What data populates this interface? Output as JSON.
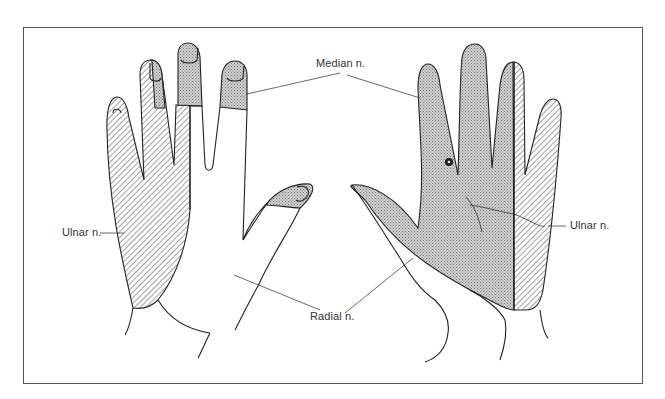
{
  "figure": {
    "title": "",
    "labels": {
      "median": "Median n.",
      "ulnar_left": "Ulnar n.",
      "ulnar_right": "Ulnar n.",
      "radial": "Radial n."
    },
    "legend": [
      {
        "pattern": "stipple",
        "nerve": "Median n."
      },
      {
        "pattern": "diagonal-hatch",
        "nerve": "Ulnar n."
      },
      {
        "pattern": "blank",
        "nerve": "Radial n."
      }
    ],
    "colors": {
      "outline": "#222222",
      "stipple": "#bdbdbd",
      "hatch": "#555555",
      "frame": "#555555"
    }
  }
}
